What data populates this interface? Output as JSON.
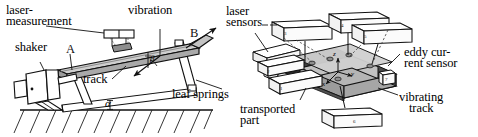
{
  "figure": {
    "panels": [
      {
        "id": "left",
        "name": "side-view",
        "description": "Side elevation of vibratory conveyor with shaker, inclined track and leaf springs"
      },
      {
        "id": "right",
        "name": "isometric-view",
        "description": "Isometric view of vibrating track with laser sensors and transported part"
      }
    ]
  },
  "left_panel": {
    "labels": {
      "laser_measurement_line1": "laser-",
      "laser_measurement_line2": "measurement",
      "vibration": "vibration",
      "shaker": "shaker",
      "track": "track",
      "leaf_springs": "leaf springs"
    },
    "symbols": {
      "point_a": "A",
      "point_b": "B",
      "angle_alpha": "α",
      "angle_beta": "β"
    }
  },
  "right_panel": {
    "labels": {
      "laser_sensors_line1": "laser",
      "laser_sensors_line2": "sensors",
      "eddy_current_line1": "eddy cur-",
      "eddy_current_line2": "rent sensor",
      "transported_part_line1": "transported",
      "transported_part_line2": "part",
      "vibrating_track_line1": "vibrating",
      "vibrating_track_line2": "track"
    },
    "item_numbers": [
      "1",
      "2",
      "3",
      "4",
      "5",
      "6",
      "7"
    ],
    "axes": {
      "x": "x",
      "y": "y",
      "z": "z"
    }
  },
  "colors": {
    "ink": "#111111",
    "line": "#1a1a1a",
    "track_fill": "#b9b9b9",
    "track_dark": "#585858",
    "plate_fill": "#c9c9c9",
    "plate_mid": "#a8a8a8",
    "plate_light": "#dedede",
    "white": "#ffffff",
    "hatch": "#2a2a2a"
  }
}
